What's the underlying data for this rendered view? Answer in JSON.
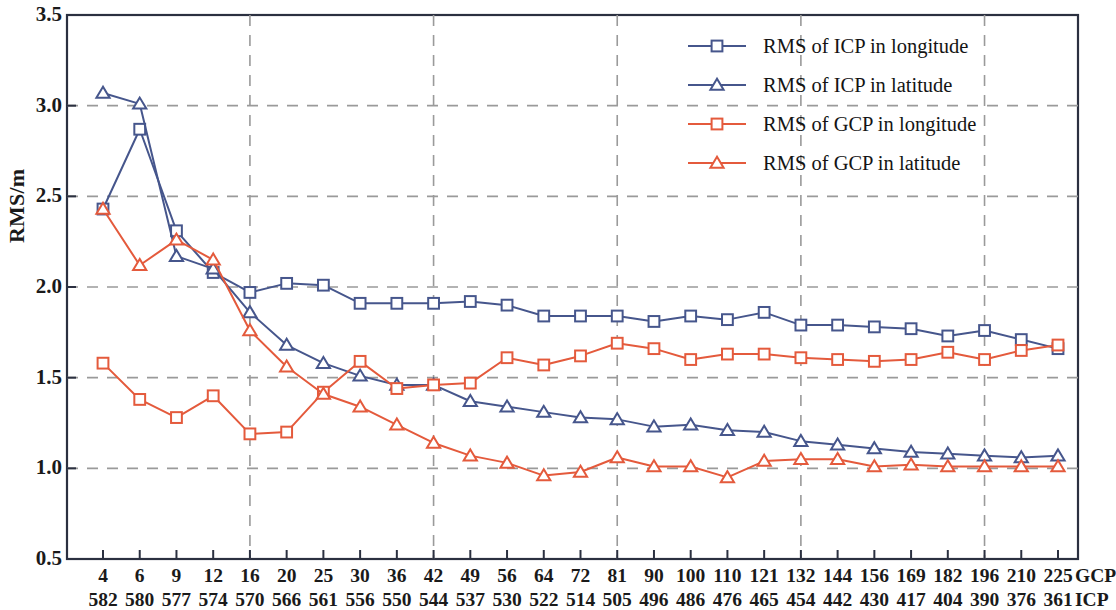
{
  "chart_data": {
    "type": "line",
    "title": "",
    "xlabel": "",
    "ylabel": "RMS/m",
    "ylim": [
      0.5,
      3.5
    ],
    "yticks": [
      "0.5",
      "1.0",
      "1.5",
      "2.0",
      "2.5",
      "3.0",
      "3.5"
    ],
    "grid": true,
    "grid_style": "dashed",
    "legend_position": "top-right",
    "x_axis_rows": [
      {
        "unit": "GCP",
        "categories": [
          "4",
          "6",
          "9",
          "12",
          "16",
          "20",
          "25",
          "30",
          "36",
          "42",
          "49",
          "56",
          "64",
          "72",
          "81",
          "90",
          "100",
          "110",
          "121",
          "132",
          "144",
          "156",
          "169",
          "182",
          "196",
          "210",
          "225"
        ]
      },
      {
        "unit": "ICP",
        "categories": [
          "582",
          "580",
          "577",
          "574",
          "570",
          "566",
          "561",
          "556",
          "550",
          "544",
          "537",
          "530",
          "522",
          "514",
          "505",
          "496",
          "486",
          "476",
          "465",
          "454",
          "442",
          "430",
          "417",
          "404",
          "390",
          "376",
          "361"
        ]
      }
    ],
    "categories": [
      "4",
      "6",
      "9",
      "12",
      "16",
      "20",
      "25",
      "30",
      "36",
      "42",
      "49",
      "56",
      "64",
      "72",
      "81",
      "90",
      "100",
      "110",
      "121",
      "132",
      "144",
      "156",
      "169",
      "182",
      "196",
      "210",
      "225"
    ],
    "series": [
      {
        "name": "RMS of ICP in longitude",
        "color": "#46568c",
        "marker": "square",
        "values": [
          2.43,
          2.87,
          2.31,
          2.08,
          1.97,
          2.02,
          2.01,
          1.91,
          1.91,
          1.91,
          1.92,
          1.9,
          1.84,
          1.84,
          1.84,
          1.81,
          1.84,
          1.82,
          1.86,
          1.79,
          1.79,
          1.78,
          1.77,
          1.73,
          1.76,
          1.71,
          1.66
        ]
      },
      {
        "name": "RMS of ICP in latitude",
        "color": "#46568c",
        "marker": "triangle",
        "values": [
          3.07,
          3.01,
          2.17,
          2.1,
          1.86,
          1.68,
          1.58,
          1.51,
          1.46,
          1.46,
          1.37,
          1.34,
          1.31,
          1.28,
          1.27,
          1.23,
          1.24,
          1.21,
          1.2,
          1.15,
          1.13,
          1.11,
          1.09,
          1.08,
          1.07,
          1.06,
          1.07
        ]
      },
      {
        "name": "RMS of GCP in longitude",
        "color": "#e45a3c",
        "marker": "square",
        "values": [
          1.58,
          1.38,
          1.28,
          1.4,
          1.19,
          1.2,
          1.42,
          1.59,
          1.44,
          1.46,
          1.47,
          1.61,
          1.57,
          1.62,
          1.69,
          1.66,
          1.6,
          1.63,
          1.63,
          1.61,
          1.6,
          1.59,
          1.6,
          1.64,
          1.6,
          1.65,
          1.68
        ]
      },
      {
        "name": "RMS of GCP in latitude",
        "color": "#e45a3c",
        "marker": "triangle",
        "values": [
          2.43,
          2.12,
          2.26,
          2.15,
          1.76,
          1.56,
          1.41,
          1.34,
          1.24,
          1.14,
          1.07,
          1.03,
          0.96,
          0.98,
          1.06,
          1.01,
          1.01,
          0.95,
          1.04,
          1.05,
          1.05,
          1.01,
          1.02,
          1.01,
          1.01,
          1.01,
          1.01
        ]
      }
    ],
    "legend": [
      {
        "label": "RMS of ICP in longitude",
        "color": "#46568c",
        "marker": "square"
      },
      {
        "label": "RMS of ICP in latitude",
        "color": "#46568c",
        "marker": "triangle"
      },
      {
        "label": "RMS of GCP in longitude",
        "color": "#e45a3c",
        "marker": "square"
      },
      {
        "label": "RMS of GCP in latitude",
        "color": "#e45a3c",
        "marker": "triangle"
      }
    ]
  },
  "axis": {
    "y_title": "RMS/m"
  }
}
